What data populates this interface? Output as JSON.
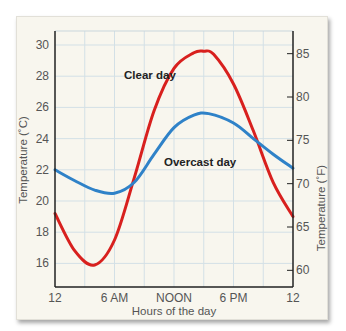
{
  "chart_data": {
    "type": "line",
    "title": "",
    "xlabel": "Hours of the day",
    "ylabel": "Temperature (˚C)",
    "ylabel_right": "Temperature (˚F)",
    "x_ticks": [
      {
        "value": 0,
        "label": "12"
      },
      {
        "value": 6,
        "label": "6 AM"
      },
      {
        "value": 12,
        "label": "NOON"
      },
      {
        "value": 18,
        "label": "6 PM"
      },
      {
        "value": 24,
        "label": "12"
      }
    ],
    "xlim": [
      0,
      24
    ],
    "ylim": [
      14.5,
      31
    ],
    "y_ticks": [
      16,
      18,
      20,
      22,
      24,
      26,
      28,
      30
    ],
    "y_ticks_right": [
      60,
      65,
      70,
      75,
      80,
      85
    ],
    "grid": true,
    "series": [
      {
        "name": "Clear day",
        "color": "#d8201e",
        "x": [
          0,
          2,
          4,
          6,
          8,
          10,
          12,
          14,
          15,
          16,
          18,
          20,
          22,
          24
        ],
        "values": [
          19.2,
          16.8,
          15.9,
          17.5,
          21.5,
          25.8,
          28.5,
          29.5,
          29.6,
          29.4,
          27.5,
          24.5,
          21.2,
          19.0
        ]
      },
      {
        "name": "Overcast day",
        "color": "#2f82c8",
        "x": [
          0,
          2,
          4,
          6,
          8,
          10,
          12,
          14,
          15.5,
          18,
          20,
          22,
          24
        ],
        "values": [
          22.0,
          21.3,
          20.7,
          20.5,
          21.2,
          23.0,
          24.7,
          25.5,
          25.6,
          25.0,
          24.0,
          23.0,
          22.1
        ]
      }
    ],
    "annotations": [
      {
        "text": "Clear day",
        "series": "Clear day"
      },
      {
        "text": "Overcast day",
        "series": "Overcast day"
      }
    ]
  }
}
